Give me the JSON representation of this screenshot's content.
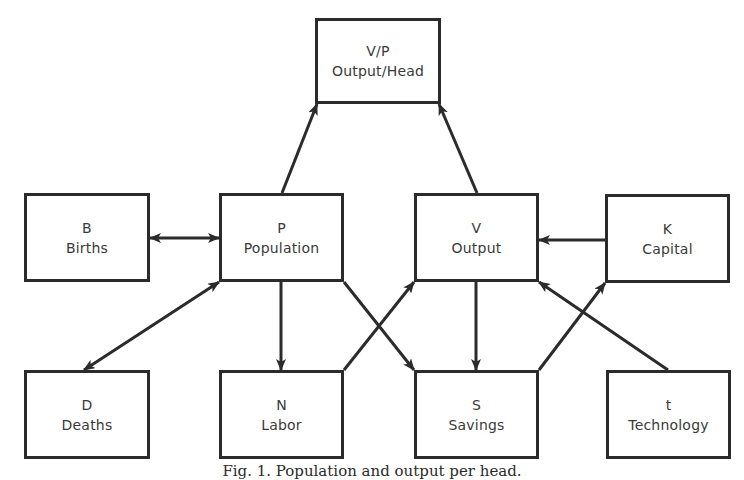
{
  "diagram": {
    "nodes": [
      {
        "id": "vp",
        "symbol": "V/P",
        "label": "Output/Head",
        "x": 315,
        "y": 18,
        "w": 126,
        "h": 86
      },
      {
        "id": "b",
        "symbol": "B",
        "label": "Births",
        "x": 24,
        "y": 193,
        "w": 126,
        "h": 89
      },
      {
        "id": "p",
        "symbol": "P",
        "label": "Population",
        "x": 219,
        "y": 193,
        "w": 125,
        "h": 89
      },
      {
        "id": "v",
        "symbol": "V",
        "label": "Output",
        "x": 414,
        "y": 193,
        "w": 125,
        "h": 89
      },
      {
        "id": "k",
        "symbol": "K",
        "label": "Capital",
        "x": 605,
        "y": 194,
        "w": 125,
        "h": 89
      },
      {
        "id": "d",
        "symbol": "D",
        "label": "Deaths",
        "x": 24,
        "y": 370,
        "w": 126,
        "h": 89
      },
      {
        "id": "n",
        "symbol": "N",
        "label": "Labor",
        "x": 219,
        "y": 370,
        "w": 125,
        "h": 89
      },
      {
        "id": "s",
        "symbol": "S",
        "label": "Savings",
        "x": 414,
        "y": 370,
        "w": 125,
        "h": 89
      },
      {
        "id": "t",
        "symbol": "t",
        "label": "Technology",
        "x": 606,
        "y": 370,
        "w": 125,
        "h": 89
      }
    ],
    "edges": [
      {
        "from": "p",
        "to": "vp",
        "x1": 282,
        "y1": 193,
        "x2": 317,
        "y2": 104,
        "bidirectional": false
      },
      {
        "from": "v",
        "to": "vp",
        "x1": 477,
        "y1": 193,
        "x2": 439,
        "y2": 104,
        "bidirectional": false
      },
      {
        "from": "b",
        "to": "p",
        "x1": 150,
        "y1": 238,
        "x2": 219,
        "y2": 238,
        "bidirectional": true
      },
      {
        "from": "k",
        "to": "v",
        "x1": 605,
        "y1": 240,
        "x2": 539,
        "y2": 240,
        "bidirectional": false
      },
      {
        "from": "d",
        "to": "p",
        "x1": 84,
        "y1": 370,
        "x2": 219,
        "y2": 282,
        "bidirectional": true
      },
      {
        "from": "p",
        "to": "n",
        "x1": 281,
        "y1": 282,
        "x2": 281,
        "y2": 370,
        "bidirectional": false
      },
      {
        "from": "p",
        "to": "s",
        "x1": 344,
        "y1": 282,
        "x2": 414,
        "y2": 370,
        "bidirectional": false
      },
      {
        "from": "n",
        "to": "v",
        "x1": 344,
        "y1": 370,
        "x2": 414,
        "y2": 282,
        "bidirectional": false
      },
      {
        "from": "v",
        "to": "s",
        "x1": 476,
        "y1": 282,
        "x2": 476,
        "y2": 370,
        "bidirectional": false
      },
      {
        "from": "s",
        "to": "k",
        "x1": 539,
        "y1": 370,
        "x2": 605,
        "y2": 283,
        "bidirectional": false
      },
      {
        "from": "t",
        "to": "v",
        "x1": 668,
        "y1": 370,
        "x2": 539,
        "y2": 282,
        "bidirectional": false
      }
    ],
    "caption": "Fig. 1. Population and output per head."
  },
  "colors": {
    "line": "#2b2b2b",
    "text": "#3a3a3a",
    "background": "#ffffff"
  }
}
